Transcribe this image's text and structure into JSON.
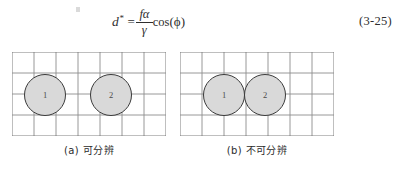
{
  "equation": {
    "lhs_variable": "d",
    "lhs_superscript": "*",
    "equals": "=",
    "numerator": "fα",
    "denominator": "γ",
    "cos_function": "cos",
    "open_paren": "(",
    "angle_symbol": "ϕ",
    "close_paren": ")",
    "number": "(3-25)"
  },
  "figure": {
    "grid": {
      "columns": 7,
      "rows": 4,
      "line_color": "#8c8c8c",
      "border_color": "#6f6f6f"
    },
    "circle_style": {
      "fill": "#d9d9d9",
      "stroke": "#3a3a3a"
    },
    "panels": [
      {
        "id": "a",
        "caption": "(a) 可分辨",
        "circles": [
          {
            "label": "1",
            "cx": 33,
            "cy": 43,
            "r": 21
          },
          {
            "label": "2",
            "cx": 99,
            "cy": 43,
            "r": 21
          }
        ]
      },
      {
        "id": "b",
        "caption": "(b) 不可分辨",
        "circles": [
          {
            "label": "1",
            "cx": 44,
            "cy": 43,
            "r": 21
          },
          {
            "label": "2",
            "cx": 85,
            "cy": 43,
            "r": 21
          }
        ]
      }
    ]
  }
}
